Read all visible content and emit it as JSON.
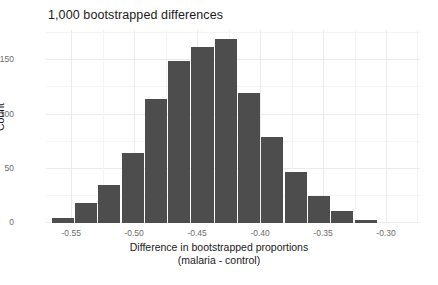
{
  "chart_data": {
    "type": "bar",
    "title": "1,000 bootstrapped differences",
    "xlabel": "Difference in bootstrapped proportions",
    "xlabel_line2": "(malaria - control)",
    "ylabel": "Count",
    "grid": true,
    "legend": "none",
    "bar_color": "#4d4d4d",
    "xlim": [
      -0.57,
      -0.273
    ],
    "ylim": [
      0,
      178
    ],
    "xticks": [
      -0.55,
      -0.5,
      -0.45,
      -0.4,
      -0.35,
      -0.3
    ],
    "xtick_labels": [
      "-0.55",
      "-0.50",
      "-0.45",
      "-0.40",
      "-0.35",
      "-0.30"
    ],
    "xticks_minor": [
      -0.525,
      -0.475,
      -0.425,
      -0.375,
      -0.325,
      -0.275
    ],
    "yticks": [
      0,
      50,
      100,
      150
    ],
    "ytick_labels": [
      "0",
      "50",
      "100",
      "150"
    ],
    "yticks_minor": [
      25,
      75,
      125,
      175
    ],
    "bin_width": 0.0185,
    "bins": [
      {
        "x_left": -0.5655,
        "x_right": -0.547,
        "center": -0.5563,
        "count": 5
      },
      {
        "x_left": -0.547,
        "x_right": -0.5285,
        "center": -0.5378,
        "count": 18
      },
      {
        "x_left": -0.5285,
        "x_right": -0.51,
        "center": -0.5193,
        "count": 35
      },
      {
        "x_left": -0.51,
        "x_right": -0.4915,
        "center": -0.5008,
        "count": 65
      },
      {
        "x_left": -0.4915,
        "x_right": -0.473,
        "center": -0.4823,
        "count": 114
      },
      {
        "x_left": -0.473,
        "x_right": -0.4545,
        "center": -0.4638,
        "count": 149
      },
      {
        "x_left": -0.4545,
        "x_right": -0.436,
        "center": -0.4453,
        "count": 162
      },
      {
        "x_left": -0.436,
        "x_right": -0.4175,
        "center": -0.4268,
        "count": 170
      },
      {
        "x_left": -0.4175,
        "x_right": -0.399,
        "center": -0.4083,
        "count": 120
      },
      {
        "x_left": -0.399,
        "x_right": -0.3805,
        "center": -0.3898,
        "count": 79
      },
      {
        "x_left": -0.3805,
        "x_right": -0.362,
        "center": -0.3713,
        "count": 47
      },
      {
        "x_left": -0.362,
        "x_right": -0.3435,
        "center": -0.3528,
        "count": 25
      },
      {
        "x_left": -0.3435,
        "x_right": -0.325,
        "center": -0.3343,
        "count": 11
      },
      {
        "x_left": -0.325,
        "x_right": -0.3065,
        "center": -0.3158,
        "count": 3
      }
    ],
    "categories": [
      "-0.5563",
      "-0.5378",
      "-0.5193",
      "-0.5008",
      "-0.4823",
      "-0.4638",
      "-0.4453",
      "-0.4268",
      "-0.4083",
      "-0.3898",
      "-0.3713",
      "-0.3528",
      "-0.3343",
      "-0.3158"
    ],
    "values": [
      5,
      18,
      35,
      65,
      114,
      149,
      162,
      170,
      120,
      79,
      47,
      25,
      11,
      3
    ],
    "total_count": 1000
  }
}
